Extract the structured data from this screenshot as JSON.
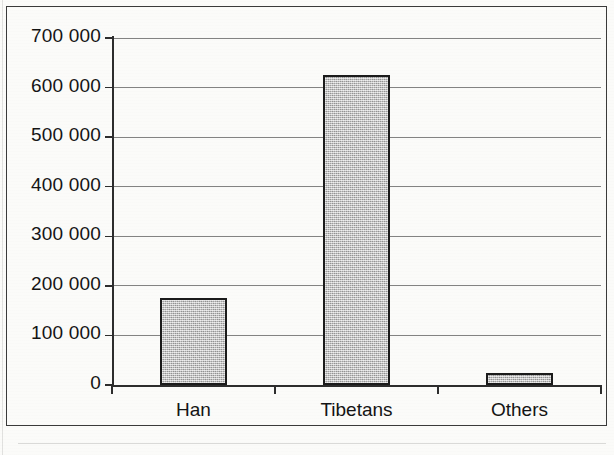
{
  "chart_data": {
    "type": "bar",
    "title": "",
    "subtitle": "",
    "xlabel": "",
    "ylabel": "",
    "categories": [
      "Han",
      "Tibetans",
      "Others"
    ],
    "values": [
      175000,
      625000,
      25000
    ],
    "series": [
      {
        "name": "Population",
        "values": [
          175000,
          625000,
          25000
        ]
      }
    ],
    "ylim": [
      0,
      700000
    ],
    "y_tick_step": 100000,
    "y_tick_labels": [
      "700 000",
      "600 000",
      "500 000",
      "400 000",
      "300 000",
      "200 000",
      "100 000",
      "0"
    ],
    "y_tick_values": [
      700000,
      600000,
      500000,
      400000,
      300000,
      200000,
      100000,
      0
    ],
    "grid": true,
    "grid_axis": "y",
    "legend": false,
    "legend_position": "none",
    "annotations": [],
    "colors": {
      "bar_fill": "#bcbcbc",
      "bar_border": "#1b1b1b",
      "gridline": "#6d6d6d",
      "axis": "#2d2d2d",
      "text": "#141414",
      "background": "#fbfbf9",
      "frame_border": "#3a3a3a"
    }
  }
}
